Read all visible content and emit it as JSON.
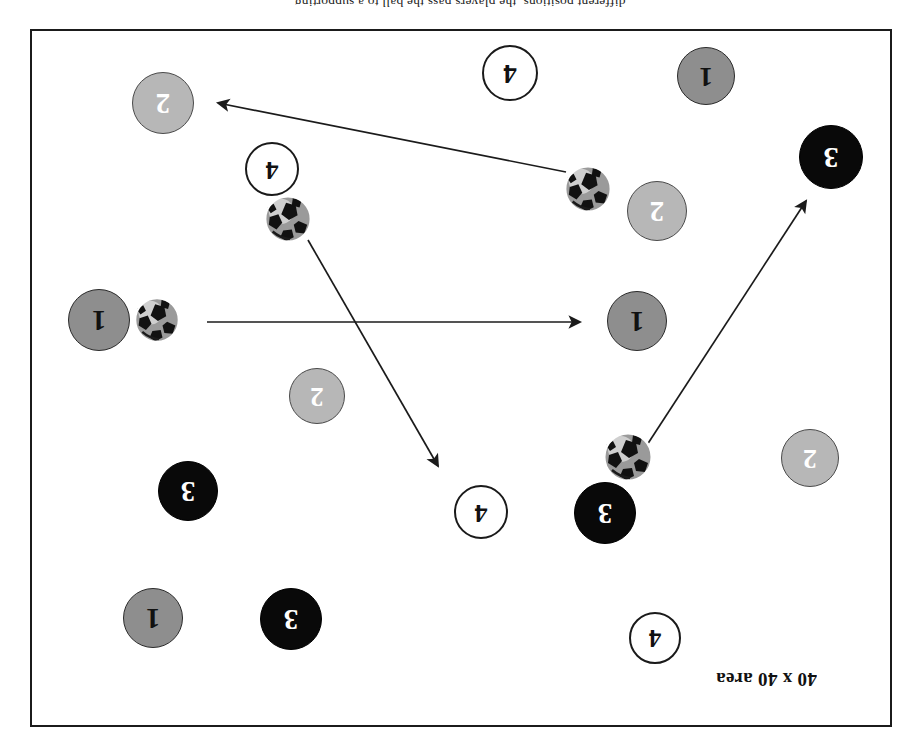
{
  "page": {
    "background_color": "#ffffff",
    "orientation_note": "upside-down",
    "clipped_top_caption": "different positions, the players pass the ball to a supporting"
  },
  "field": {
    "border_color": "#1b1b1b",
    "fill_color": "#ffffff",
    "area_label": "40 x 40 area",
    "x": 30,
    "y": 29,
    "width": 862,
    "height": 698
  },
  "legend_colors": {
    "team1": "#8e8e8e",
    "team2": "#b7b7b7",
    "team3": "#090909",
    "team4": "#ffffff",
    "outline": "#1a1a1a",
    "arrow": "#1b1b1b"
  },
  "players": [
    {
      "label": "2",
      "team": "team2",
      "cx": 163,
      "cy": 103,
      "r": 31
    },
    {
      "label": "4",
      "team": "team4",
      "cx": 510,
      "cy": 73,
      "r": 28
    },
    {
      "label": "1",
      "team": "team1",
      "cx": 706,
      "cy": 76,
      "r": 29
    },
    {
      "label": "4",
      "team": "team4",
      "cx": 272,
      "cy": 169,
      "r": 27
    },
    {
      "label": "3",
      "team": "team3",
      "cx": 831,
      "cy": 157,
      "r": 32
    },
    {
      "label": "2",
      "team": "team2",
      "cx": 657,
      "cy": 211,
      "r": 30
    },
    {
      "label": "1",
      "team": "team1",
      "cx": 99,
      "cy": 320,
      "r": 31
    },
    {
      "label": "1",
      "team": "team1",
      "cx": 637,
      "cy": 321,
      "r": 30
    },
    {
      "label": "2",
      "team": "team2",
      "cx": 317,
      "cy": 396,
      "r": 28
    },
    {
      "label": "2",
      "team": "team2",
      "cx": 810,
      "cy": 458,
      "r": 29
    },
    {
      "label": "3",
      "team": "team3",
      "cx": 188,
      "cy": 491,
      "r": 30
    },
    {
      "label": "4",
      "team": "team4",
      "cx": 481,
      "cy": 512,
      "r": 27
    },
    {
      "label": "3",
      "team": "team3",
      "cx": 605,
      "cy": 513,
      "r": 31
    },
    {
      "label": "1",
      "team": "team1",
      "cx": 153,
      "cy": 618,
      "r": 30
    },
    {
      "label": "3",
      "team": "team3",
      "cx": 291,
      "cy": 619,
      "r": 31
    },
    {
      "label": "4",
      "team": "team4",
      "cx": 655,
      "cy": 638,
      "r": 26
    }
  ],
  "balls": [
    {
      "name": "ball-top-right",
      "cx": 588,
      "cy": 189,
      "r": 24
    },
    {
      "name": "ball-upper-left",
      "cx": 288,
      "cy": 219,
      "r": 24
    },
    {
      "name": "ball-left-middle",
      "cx": 157,
      "cy": 320,
      "r": 23
    },
    {
      "name": "ball-lower-middle",
      "cx": 628,
      "cy": 457,
      "r": 25
    }
  ],
  "arrows": [
    {
      "name": "pass-arrow-to-player-2-top-left",
      "x1": 566,
      "y1": 172,
      "x2": 214,
      "y2": 102
    },
    {
      "name": "pass-arrow-to-player-4-center",
      "x1": 308,
      "y1": 240,
      "x2": 440,
      "y2": 470
    },
    {
      "name": "pass-arrow-to-player-1-right",
      "x1": 207,
      "y1": 322,
      "x2": 584,
      "y2": 322
    },
    {
      "name": "pass-arrow-to-player-3-right",
      "x1": 647,
      "y1": 445,
      "x2": 808,
      "y2": 197
    }
  ]
}
